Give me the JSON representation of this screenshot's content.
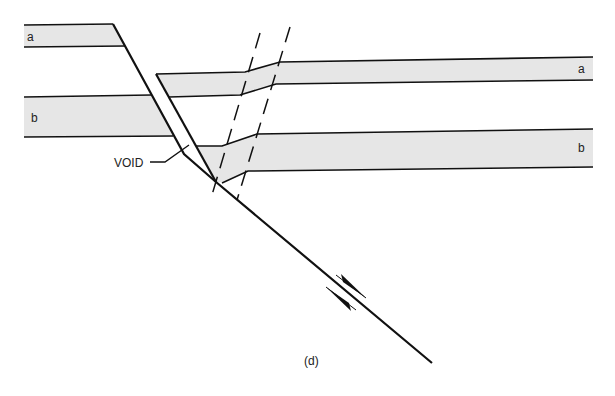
{
  "figure": {
    "panel_label": "(d)",
    "void_label": "VOID",
    "bed_labels": {
      "a_left": "a",
      "b_left": "b",
      "a_right": "a",
      "b_right": "b"
    },
    "colors": {
      "bed_fill": "#e6e6e6",
      "line": "#111111",
      "background": "#ffffff"
    }
  }
}
